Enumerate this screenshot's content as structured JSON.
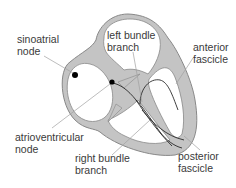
{
  "diagram": {
    "type": "cardiac conduction system",
    "colors": {
      "tissue_fill": "#c4c4c4",
      "tissue_outline": "#888888",
      "leader_line": "#a0a0a0",
      "pathway_line": "#2a2a2a",
      "node_dot": "#000000",
      "background": "#ffffff"
    },
    "labels": {
      "sinoatrial": {
        "line1": "sinoatrial",
        "line2": "node"
      },
      "left_bundle": {
        "line1": "left bundle",
        "line2": "branch"
      },
      "anterior": {
        "line1": "anterior",
        "line2": "fascicle"
      },
      "atrioventricular": {
        "line1": "atrioventricular",
        "line2": "node"
      },
      "right_bundle": {
        "line1": "right bundle",
        "line2": "branch"
      },
      "posterior": {
        "line1": "posterior",
        "line2": "fascicle"
      }
    }
  }
}
